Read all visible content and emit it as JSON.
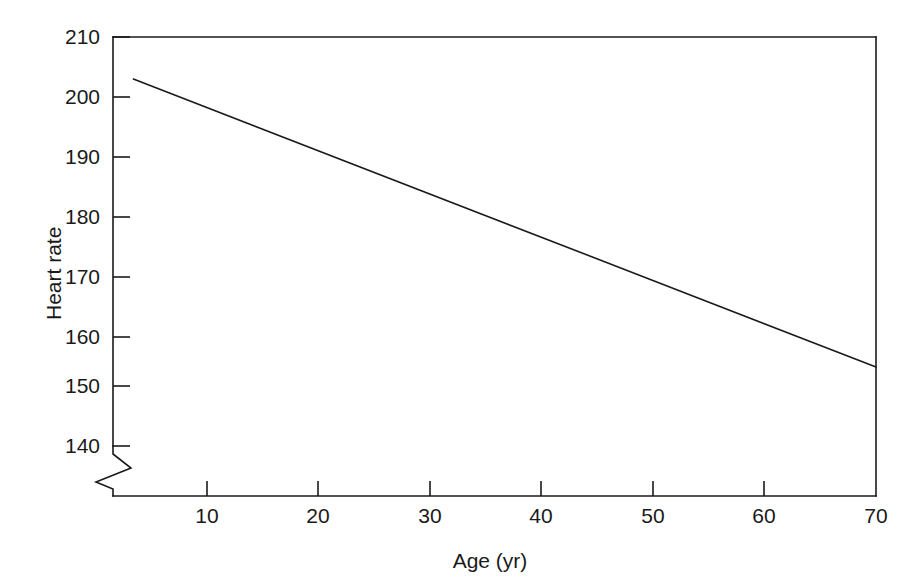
{
  "chart_data": {
    "type": "line",
    "title": "",
    "subtitle": "",
    "xlabel": "Age (yr)",
    "ylabel": "Heart rate",
    "xlim": [
      0,
      70
    ],
    "ylim": [
      133,
      210
    ],
    "xticks": [
      10,
      20,
      30,
      40,
      50,
      60,
      70
    ],
    "yticks": [
      140,
      150,
      160,
      170,
      180,
      190,
      200,
      210
    ],
    "xtick_labels": [
      "10",
      "20",
      "30",
      "40",
      "50",
      "60",
      "70"
    ],
    "ytick_labels": [
      "140",
      "150",
      "160",
      "170",
      "180",
      "190",
      "200",
      "210"
    ],
    "grid": false,
    "legend": null,
    "legend_position": "none",
    "axis_break": {
      "axis": "y",
      "symbol": "zigzag",
      "below_value": 140,
      "description": "broken y-axis below 140"
    },
    "series": [
      {
        "name": "Maximal heart rate",
        "color": "#1a1a1a",
        "line_width": 1.6,
        "x": [
          3.4,
          70
        ],
        "y": [
          203,
          155
        ],
        "points": [
          {
            "x": 3.4,
            "y": 203
          },
          {
            "x": 10,
            "y": 198.2
          },
          {
            "x": 20,
            "y": 191
          },
          {
            "x": 30,
            "y": 183.8
          },
          {
            "x": 40,
            "y": 176.6
          },
          {
            "x": 50,
            "y": 169.4
          },
          {
            "x": 60,
            "y": 162.2
          },
          {
            "x": 70,
            "y": 155
          }
        ]
      }
    ],
    "annotations": []
  },
  "axes": {
    "frame_color": "#1a1a1a",
    "tick_color": "#1a1a1a",
    "background": "#ffffff"
  }
}
